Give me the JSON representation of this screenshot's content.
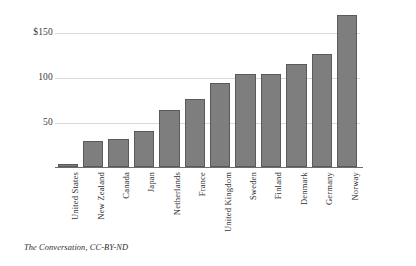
{
  "caption": "The Conversation, CC-BY-ND",
  "chart_data": {
    "type": "bar",
    "title": "",
    "subtitle": "",
    "xlabel": "",
    "ylabel": "",
    "categories": [
      "United States",
      "New Zealand",
      "Canada",
      "Japan",
      "Netherlands",
      "France",
      "United Kingdom",
      "Sweden",
      "Finland",
      "Denmark",
      "Germany",
      "Norway"
    ],
    "values": [
      3,
      29,
      32,
      41,
      64,
      77,
      95,
      105,
      105,
      117,
      128,
      172
    ],
    "ylim": [
      0,
      180
    ],
    "yticks": [
      50,
      100,
      150
    ],
    "ytick_labels": [
      "50",
      "100",
      "$150"
    ],
    "grid": true,
    "legend": "none",
    "bar_color": "#7e7e7e",
    "bar_border_color": "#5a5a5a",
    "gridline_color": "#d9d9d9",
    "axis_color": "#6d6d6d"
  }
}
